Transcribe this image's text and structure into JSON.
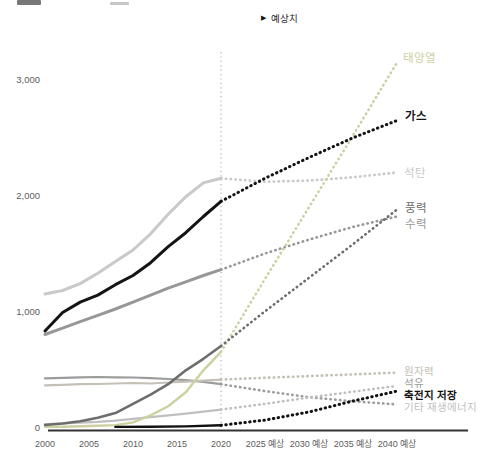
{
  "page": {
    "annotation": {
      "icon": "▶",
      "label": "예상치"
    }
  },
  "chart_data": {
    "type": "line",
    "title": "",
    "forecast_boundary_year": 2020,
    "grid": false,
    "legend_position": "right-edge-labels",
    "ylim": [
      0,
      3250
    ],
    "y_ticks": [
      {
        "label": "0",
        "value": 0
      },
      {
        "label": "1,000",
        "value": 1000
      },
      {
        "label": "2,000",
        "value": 2000
      },
      {
        "label": "3,000",
        "value": 3000
      }
    ],
    "x_ticks": [
      {
        "label": "2000",
        "year": 2000
      },
      {
        "label": "2005",
        "year": 2005
      },
      {
        "label": "2010",
        "year": 2010
      },
      {
        "label": "2015",
        "year": 2015
      },
      {
        "label": "2020",
        "year": 2020
      },
      {
        "label": "2025 예상",
        "year": 2025
      },
      {
        "label": "2030 예상",
        "year": 2030
      },
      {
        "label": "2035 예상",
        "year": 2035
      },
      {
        "label": "2040 예상",
        "year": 2040
      }
    ],
    "series": [
      {
        "id": "solar",
        "label": "태양열",
        "color": "#cdd0a0",
        "bold_label": false,
        "historical": {
          "years": [
            2000,
            2002,
            2004,
            2006,
            2008,
            2010,
            2012,
            2014,
            2016,
            2018,
            2020
          ],
          "values": [
            1,
            3,
            6,
            10,
            16,
            40,
            100,
            180,
            300,
            490,
            650
          ]
        },
        "forecast": {
          "years": [
            2020,
            2025,
            2030,
            2035,
            2040
          ],
          "values": [
            650,
            1280,
            1900,
            2520,
            3150
          ]
        }
      },
      {
        "id": "gas",
        "label": "가스",
        "color": "#141414",
        "bold_label": true,
        "historical": {
          "years": [
            2000,
            2002,
            2004,
            2006,
            2008,
            2010,
            2012,
            2014,
            2016,
            2018,
            2020
          ],
          "values": [
            830,
            990,
            1080,
            1140,
            1230,
            1310,
            1420,
            1560,
            1680,
            1820,
            1950
          ]
        },
        "forecast": {
          "years": [
            2020,
            2025,
            2030,
            2035,
            2040
          ],
          "values": [
            1950,
            2150,
            2330,
            2500,
            2650
          ]
        }
      },
      {
        "id": "coal",
        "label": "석탄",
        "color": "#c9c9c9",
        "bold_label": false,
        "historical": {
          "years": [
            2000,
            2002,
            2004,
            2006,
            2008,
            2010,
            2012,
            2014,
            2016,
            2018,
            2020
          ],
          "values": [
            1150,
            1180,
            1240,
            1330,
            1430,
            1530,
            1670,
            1840,
            1990,
            2110,
            2150
          ]
        },
        "forecast": {
          "years": [
            2020,
            2025,
            2030,
            2035,
            2040
          ],
          "values": [
            2150,
            2120,
            2130,
            2160,
            2200
          ]
        }
      },
      {
        "id": "wind",
        "label": "풍력",
        "color": "#6d6d6d",
        "bold_label": false,
        "historical": {
          "years": [
            2000,
            2002,
            2004,
            2006,
            2008,
            2010,
            2012,
            2014,
            2016,
            2018,
            2020
          ],
          "values": [
            17,
            30,
            50,
            80,
            120,
            200,
            280,
            370,
            490,
            590,
            700
          ]
        },
        "forecast": {
          "years": [
            2020,
            2025,
            2030,
            2035,
            2040
          ],
          "values": [
            700,
            1000,
            1290,
            1580,
            1880
          ]
        }
      },
      {
        "id": "hydro",
        "label": "수력",
        "color": "#979797",
        "bold_label": false,
        "historical": {
          "years": [
            2000,
            2002,
            2004,
            2006,
            2008,
            2010,
            2012,
            2014,
            2016,
            2018,
            2020
          ],
          "values": [
            800,
            855,
            910,
            965,
            1020,
            1080,
            1140,
            1200,
            1255,
            1310,
            1360
          ]
        },
        "forecast": {
          "years": [
            2020,
            2025,
            2030,
            2035,
            2040
          ],
          "values": [
            1360,
            1500,
            1620,
            1730,
            1820
          ]
        }
      },
      {
        "id": "nuclear",
        "label": "원자력",
        "color": "#c4c0b6",
        "bold_label": false,
        "historical": {
          "years": [
            2000,
            2002,
            2004,
            2006,
            2008,
            2010,
            2012,
            2014,
            2016,
            2018,
            2020
          ],
          "values": [
            360,
            365,
            370,
            372,
            376,
            380,
            376,
            385,
            392,
            400,
            410
          ]
        },
        "forecast": {
          "years": [
            2020,
            2025,
            2030,
            2035,
            2040
          ],
          "values": [
            410,
            425,
            440,
            455,
            470
          ]
        }
      },
      {
        "id": "oil",
        "label": "석유",
        "color": "#9c9c9c",
        "bold_label": false,
        "historical": {
          "years": [
            2000,
            2002,
            2004,
            2006,
            2008,
            2010,
            2012,
            2014,
            2016,
            2018,
            2020
          ],
          "values": [
            420,
            425,
            430,
            432,
            430,
            428,
            422,
            415,
            405,
            390,
            370
          ]
        },
        "forecast": {
          "years": [
            2020,
            2025,
            2030,
            2035,
            2040
          ],
          "values": [
            370,
            310,
            258,
            222,
            195
          ]
        }
      },
      {
        "id": "battery",
        "label": "축전지 저장",
        "color": "#111111",
        "bold_label": true,
        "historical": {
          "years": [
            2008,
            2012,
            2016,
            2020
          ],
          "values": [
            1,
            2,
            5,
            15
          ]
        },
        "forecast": {
          "years": [
            2020,
            2025,
            2030,
            2035,
            2040
          ],
          "values": [
            15,
            60,
            130,
            225,
            310
          ]
        }
      },
      {
        "id": "other_renewables",
        "label": "기타 재생에너지",
        "color": "#bfbfbf",
        "bold_label": false,
        "historical": {
          "years": [
            2000,
            2002,
            2004,
            2006,
            2008,
            2010,
            2012,
            2014,
            2016,
            2018,
            2020
          ],
          "values": [
            25,
            30,
            38,
            45,
            55,
            70,
            85,
            100,
            115,
            132,
            150
          ]
        },
        "forecast": {
          "years": [
            2020,
            2025,
            2030,
            2035,
            2040
          ],
          "values": [
            150,
            200,
            255,
            305,
            355
          ]
        }
      }
    ],
    "colors": {
      "axis": "#333333",
      "divider": "#b0b0b0",
      "tick_text": "#5c5c5c",
      "annotation_text": "#222222"
    }
  }
}
